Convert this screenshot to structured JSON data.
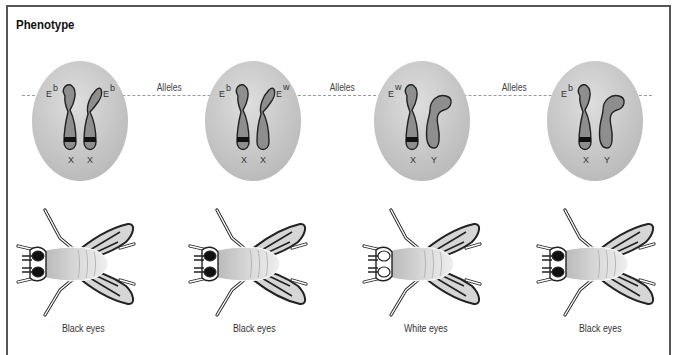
{
  "title": "Phenotype",
  "line_label": "Alleles",
  "alleles_labels": [
    "Alleles",
    "Alleles",
    "Alleles"
  ],
  "cells": [
    {
      "id": "female-homozygous",
      "left_allele": {
        "base": "E",
        "sup": "b"
      },
      "right_allele": {
        "base": "E",
        "sup": "b"
      },
      "chromosomes": [
        "X",
        "X"
      ],
      "phenotype": "Black eyes",
      "eye_color": "#111111"
    },
    {
      "id": "female-heterozygous",
      "left_allele": {
        "base": "E",
        "sup": "b"
      },
      "right_allele": {
        "base": "E",
        "sup": "w"
      },
      "chromosomes": [
        "X",
        "X"
      ],
      "phenotype": "Black eyes",
      "eye_color": "#111111"
    },
    {
      "id": "male-white",
      "left_allele": {
        "base": "E",
        "sup": "w"
      },
      "right_allele": null,
      "chromosomes": [
        "X",
        "Y"
      ],
      "phenotype": "White eyes",
      "eye_color": "#ffffff"
    },
    {
      "id": "male-black",
      "left_allele": {
        "base": "E",
        "sup": "b"
      },
      "right_allele": null,
      "chromosomes": [
        "X",
        "Y"
      ],
      "phenotype": "Black eyes",
      "eye_color": "#111111"
    }
  ],
  "colors": {
    "cell_fill": "#c8c8c8",
    "chromosome_fill": "#8e8e8e",
    "band": "#111111",
    "dash": "#9a9a9a",
    "border": "#555555"
  }
}
